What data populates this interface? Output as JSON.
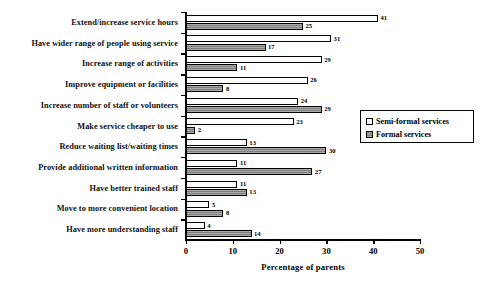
{
  "chart_data": {
    "type": "bar",
    "orientation": "horizontal",
    "title": "",
    "xlabel": "Percentage of parents",
    "ylabel": "",
    "xlim": [
      0,
      50
    ],
    "xticks": [
      0,
      10,
      20,
      30,
      40,
      50
    ],
    "grid": false,
    "legend_position": "right",
    "categories": [
      "Extend/increase service hours",
      "Have wider range of people using service",
      "Increase range of activities",
      "Improve equipment or facilities",
      "Increase number of staff or volunteers",
      "Make service cheaper to use",
      "Reduce waiting list/waiting times",
      "Provide additional written information",
      "Have better trained staff",
      "Move to more convenient location",
      "Have more understanding staff"
    ],
    "series": [
      {
        "name": "Semi-formal services",
        "color": "#ffffff",
        "values": [
          41,
          31,
          29,
          26,
          24,
          23,
          13,
          11,
          11,
          5,
          4
        ]
      },
      {
        "name": "Formal services",
        "color": "#8c8c8c",
        "values": [
          25,
          17,
          11,
          8,
          29,
          2,
          30,
          27,
          13,
          8,
          14
        ]
      }
    ]
  },
  "legend": {
    "items": [
      {
        "label": "Semi-formal services",
        "swatch": "semi"
      },
      {
        "label": "Formal services",
        "swatch": "formal"
      }
    ]
  },
  "axis": {
    "x_title": "Percentage of parents",
    "tick_labels": [
      "0",
      "10",
      "20",
      "30",
      "40",
      "50"
    ]
  }
}
